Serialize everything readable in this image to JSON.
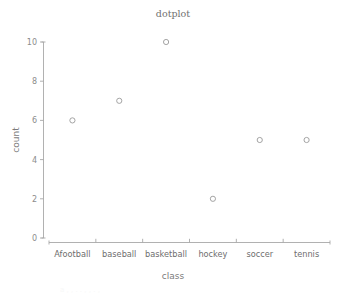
{
  "chart_data": {
    "type": "scatter",
    "title": "dotplot",
    "xlabel": "class",
    "ylabel": "count",
    "categories": [
      "Afootball",
      "baseball",
      "basketball",
      "hockey",
      "soccer",
      "tennis"
    ],
    "values": [
      6,
      7,
      10,
      2,
      5,
      5
    ],
    "ytick_labels": [
      "0",
      "2",
      "4",
      "6",
      "8",
      "10"
    ],
    "ytick_values": [
      0,
      2,
      4,
      6,
      8,
      10
    ],
    "ylim": [
      0,
      10
    ],
    "grid": false,
    "legend": false,
    "marker": "open-circle",
    "colors": {
      "axis": "#a8a8a8",
      "marker_stroke": "#9a9a9a",
      "title_text": "#6f6f6f",
      "tick_text": "#8c8c8c",
      "background": "#ffffff"
    }
  },
  "artifact": {
    "bottom_text": "a  ,    ,   .   .     ,  ,    . ,"
  }
}
